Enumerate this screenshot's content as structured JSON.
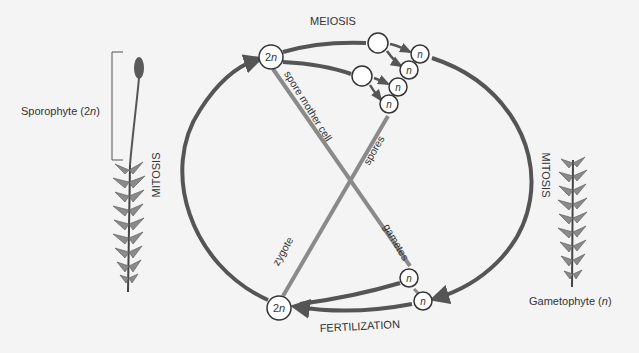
{
  "labels": {
    "meiosis": "MEIOSIS",
    "fertilization": "FERTILIZATION",
    "mitosis_left": "MITOSIS",
    "mitosis_right": "MITOSIS",
    "spore_mother_cell": "spore mother cell",
    "spores": "spores",
    "gametes": "gametes",
    "zygote": "zygote"
  },
  "stages": {
    "sporophyte": {
      "name": "Sporophyte",
      "ploidy": "2n",
      "label_prefix": "Sporophyte (",
      "label_ploidy_num": "2",
      "label_ploidy_var": "n",
      "label_suffix": ")"
    },
    "gametophyte": {
      "name": "Gametophyte",
      "ploidy": "n",
      "label_prefix": "Gametophyte (",
      "label_ploidy_var": "n",
      "label_suffix": ")"
    }
  },
  "cells": {
    "diploid_top": {
      "num": "2",
      "var": "n"
    },
    "diploid_bottom": {
      "num": "2",
      "var": "n"
    },
    "haploid": "n"
  },
  "colors": {
    "cycle_line": "#555555",
    "cross_line": "#8a8a8a",
    "text": "#333333",
    "background": "#f4f4f4",
    "plant_fill": "#7a7a7a",
    "capsule": "#5a5a5a"
  }
}
